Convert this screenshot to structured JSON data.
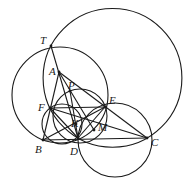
{
  "diagram": {
    "type": "geometry-figure",
    "stroke_color": "#1a1a1a",
    "background": "#ffffff",
    "points": {
      "T": {
        "label": "T",
        "x": 51,
        "y": 46,
        "lx": 40,
        "ly": 44
      },
      "A": {
        "label": "A",
        "x": 59,
        "y": 72,
        "lx": 49,
        "ly": 75
      },
      "P": {
        "label": "P",
        "x": 70,
        "y": 91,
        "lx": 68,
        "ly": 89
      },
      "F": {
        "label": "F",
        "x": 50,
        "y": 108,
        "lx": 38,
        "ly": 111
      },
      "E": {
        "label": "E",
        "x": 105,
        "y": 107,
        "lx": 109,
        "ly": 104
      },
      "K": {
        "label": "K",
        "x": 76,
        "y": 124,
        "lx": 71,
        "ly": 127
      },
      "M": {
        "label": "M",
        "x": 94,
        "y": 130,
        "lx": 98,
        "ly": 131
      },
      "B": {
        "label": "B",
        "x": 43,
        "y": 140,
        "lx": 35,
        "ly": 153
      },
      "D": {
        "label": "D",
        "x": 78,
        "y": 138,
        "lx": 70,
        "ly": 155
      },
      "C": {
        "label": "C",
        "x": 147,
        "y": 138,
        "lx": 151,
        "ly": 146
      }
    },
    "circles": [
      {
        "name": "big-circle-TDC",
        "cx": 112.5,
        "cy": 77.9,
        "r": 69.4
      },
      {
        "name": "circle-TEB",
        "cx": 60,
        "cy": 95,
        "r": 48
      },
      {
        "name": "circle-FBD",
        "cx": 62,
        "cy": 124,
        "r": 20
      },
      {
        "name": "circle-FDE",
        "cx": 80,
        "cy": 116,
        "r": 27
      },
      {
        "name": "circle-DEC",
        "cx": 115,
        "cy": 140,
        "r": 37
      }
    ],
    "segments": [
      [
        "T",
        "D"
      ],
      [
        "A",
        "B"
      ],
      [
        "A",
        "C"
      ],
      [
        "A",
        "M"
      ],
      [
        "F",
        "E"
      ],
      [
        "F",
        "D"
      ],
      [
        "F",
        "C"
      ],
      [
        "B",
        "C"
      ],
      [
        "E",
        "D"
      ],
      [
        "E",
        "B"
      ],
      [
        "P",
        "D"
      ]
    ]
  }
}
